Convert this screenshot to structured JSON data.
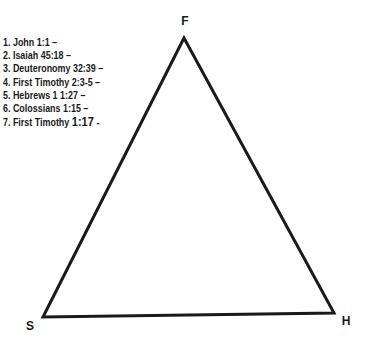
{
  "diagram": {
    "vertices": {
      "top": "F",
      "bottom_left": "S",
      "bottom_right": "H"
    },
    "references": [
      "1. John 1:1 –",
      "2. Isaiah 45:18 –",
      "3. Deuteronomy 32:39 –",
      "4. First Timothy 2:3-5 –",
      "5. Hebrews 1 1:27 –",
      "6. Colossians 1:15 –"
    ],
    "last_reference": {
      "prefix": "7. First Timothy ",
      "verse": "1:17",
      "suffix": " -"
    },
    "line_color": "#1a1a1a"
  }
}
